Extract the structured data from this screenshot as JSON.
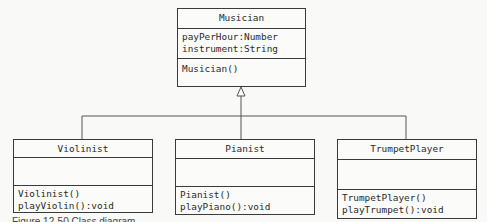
{
  "diagram": {
    "type": "uml-class-diagram",
    "relationship": "generalization",
    "superclass": {
      "name": "Musician",
      "attributes": [
        "payPerHour:Number",
        "instrument:String"
      ],
      "operations": [
        "Musician()"
      ]
    },
    "subclasses": [
      {
        "name": "Violinist",
        "attributes": [],
        "operations": [
          "Violinist()",
          "playViolin():void"
        ]
      },
      {
        "name": "Pianist",
        "attributes": [],
        "operations": [
          "Pianist()",
          "playPiano():void"
        ]
      },
      {
        "name": "TrumpetPlayer",
        "attributes": [],
        "operations": [
          "TrumpetPlayer()",
          "playTrumpet():void"
        ]
      }
    ]
  },
  "caption": "Figure 12-50 Class diagram"
}
